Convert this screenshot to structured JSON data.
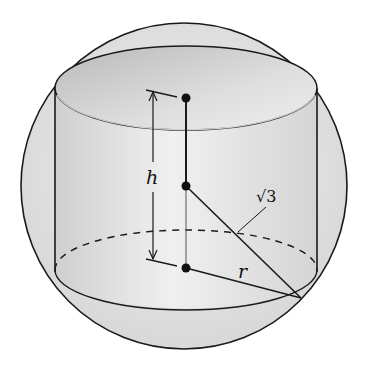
{
  "diagram": {
    "type": "cylinder inscribed in sphere",
    "labels": {
      "height": "h",
      "radius": "r",
      "sphere_radius": "√3"
    },
    "colors": {
      "stroke": "#1a1a1a",
      "sphere_fill": "#e6e6e6",
      "cylinder_fill": "#dcdcdc",
      "top_fill": "#c8c8c8"
    }
  }
}
